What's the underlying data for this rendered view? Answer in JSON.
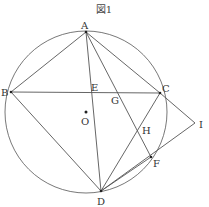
{
  "figure": {
    "title": "図1",
    "circle": {
      "center": "O",
      "cx": 86,
      "cy": 114,
      "r": 82
    },
    "points": {
      "A": {
        "label": "A",
        "x": 86,
        "y": 32
      },
      "B": {
        "label": "B",
        "x": 11,
        "y": 92
      },
      "C": {
        "label": "C",
        "x": 160,
        "y": 93
      },
      "D": {
        "label": "D",
        "x": 101,
        "y": 191
      },
      "E": {
        "label": "E",
        "x": 92,
        "y": 92
      },
      "F": {
        "label": "F",
        "x": 151,
        "y": 157
      },
      "G": {
        "label": "G",
        "x": 117,
        "y": 93
      },
      "H": {
        "label": "H",
        "x": 139,
        "y": 130
      },
      "I": {
        "label": "I",
        "x": 195,
        "y": 123
      },
      "O": {
        "label": "O",
        "x": 86,
        "y": 112
      }
    },
    "segments": [
      "AB",
      "AC",
      "AD",
      "AF",
      "BC",
      "BD",
      "CD",
      "CI",
      "DF",
      "DI"
    ]
  }
}
